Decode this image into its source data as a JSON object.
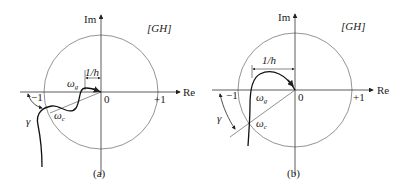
{
  "figure": {
    "panels": [
      {
        "id": "a",
        "caption": "(a)",
        "axis_im": "Im",
        "axis_re": "Re",
        "plane_label": "[GH]",
        "origin_label": "0",
        "minus_one_label": "−1",
        "plus_one_label": "+1",
        "dimension_label": "1/h",
        "omega_g_label": "ω",
        "omega_g_sub": "g",
        "omega_c_label": "ω",
        "omega_c_sub": "c",
        "phase_margin_label": "γ"
      },
      {
        "id": "b",
        "caption": "(b)",
        "axis_im": "Im",
        "axis_re": "Re",
        "plane_label": "[GH]",
        "origin_label": "0",
        "minus_one_label": "−1",
        "plus_one_label": "+1",
        "dimension_label": "1/h",
        "omega_g_label": "ω",
        "omega_g_sub": "g",
        "omega_c_label": "ω",
        "omega_c_sub": "c",
        "phase_margin_label": "γ"
      }
    ],
    "colors": {
      "curve": "#1a1a1a",
      "axis": "#333333",
      "circle": "#555555"
    }
  }
}
